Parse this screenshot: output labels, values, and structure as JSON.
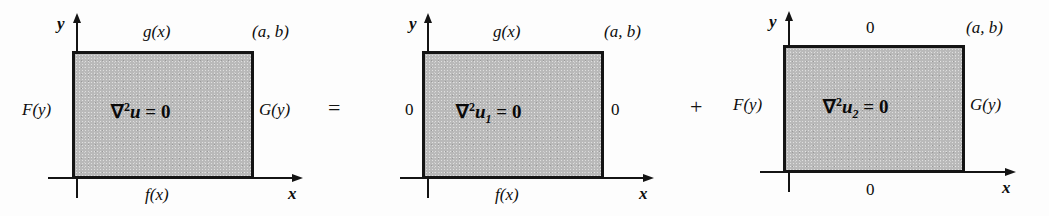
{
  "figure": {
    "operators": {
      "equals": "=",
      "plus": "+"
    },
    "axis": {
      "x": "x",
      "y": "y"
    },
    "corner": "(a, b)"
  },
  "panels": [
    {
      "id": "panel-original",
      "equation": {
        "nabla": "∇",
        "power": "2",
        "variable": "u",
        "subscript": "",
        "rhs": "= 0"
      },
      "top": "g(x)",
      "bottom": "f(x)",
      "left": "F(y)",
      "right": "G(y)",
      "corner": "(a, b)",
      "axis_x": "x",
      "axis_y": "y"
    },
    {
      "id": "panel-u1",
      "equation": {
        "nabla": "∇",
        "power": "2",
        "variable": "u",
        "subscript": "1",
        "rhs": "= 0"
      },
      "top": "g(x)",
      "bottom": "f(x)",
      "left": "0",
      "right": "0",
      "corner": "(a, b)",
      "axis_x": "x",
      "axis_y": "y"
    },
    {
      "id": "panel-u2",
      "equation": {
        "nabla": "∇",
        "power": "2",
        "variable": "u",
        "subscript": "2",
        "rhs": "= 0"
      },
      "top": "0",
      "bottom": "0",
      "left": "F(y)",
      "right": "G(y)",
      "corner": "(a, b)",
      "axis_x": "x",
      "axis_y": "y"
    }
  ],
  "colors": {
    "ink": "#141414",
    "fill": "#b9b9b9",
    "background": "#fdfdfd"
  }
}
